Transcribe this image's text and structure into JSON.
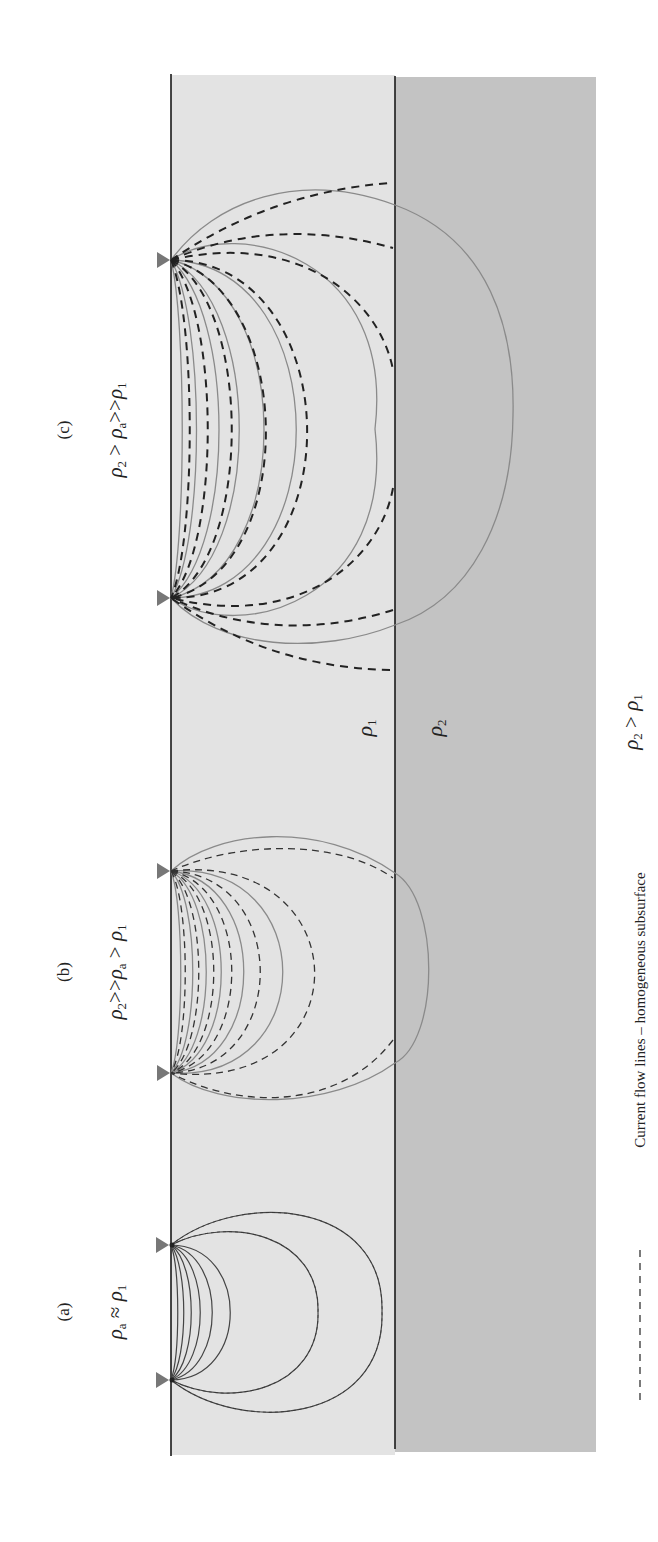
{
  "figure": {
    "orientation": "rotated-90-ccw",
    "colors": {
      "background": "#ffffff",
      "layer1_fill": "#e3e3e3",
      "layer2_fill": "#c3c3c3",
      "boundary_line": "#1a1a1a",
      "solid_flow_line": "#8a8a8a",
      "dashed_flow_line": "#222222",
      "electrode_marker": "#777777"
    },
    "panels": [
      {
        "id": "a",
        "label": "(a)",
        "condition": {
          "lhs": "ρ",
          "lhs_sub": "a",
          "op": "≈",
          "rhs": "ρ",
          "rhs_sub": "1"
        },
        "electrodes_y": [
          1245,
          1380
        ]
      },
      {
        "id": "b",
        "label": "(b)",
        "condition": {
          "lhs": "ρ",
          "lhs_sub": "2",
          "op1": ">>",
          "mid": "ρ",
          "mid_sub": "a",
          "op2": ">",
          "rhs": "ρ",
          "rhs_sub": "1"
        },
        "electrodes_y": [
          871,
          1073
        ]
      },
      {
        "id": "c",
        "label": "(c)",
        "condition": {
          "lhs": "ρ",
          "lhs_sub": "2",
          "op1": ">",
          "mid": "ρ",
          "mid_sub": "a",
          "op2": ">>",
          "rhs": "ρ",
          "rhs_sub": "1"
        },
        "electrodes_y": [
          260,
          598
        ]
      }
    ],
    "layers": {
      "layer1": {
        "symbol": "ρ",
        "sub": "1"
      },
      "layer2": {
        "symbol": "ρ",
        "sub": "2"
      }
    },
    "model_condition": {
      "lhs": "ρ",
      "lhs_sub": "2",
      "op": ">",
      "rhs": "ρ",
      "rhs_sub": "1"
    },
    "legend": {
      "dashed_label": "Current flow lines – homogeneous subsurface"
    }
  }
}
